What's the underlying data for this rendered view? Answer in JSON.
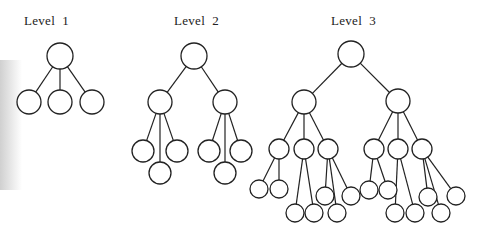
{
  "diagram": {
    "type": "tree-diagram",
    "trees": [
      {
        "label": "Level  1",
        "depth": 1,
        "root": {
          "children": [
            {},
            {},
            {}
          ]
        }
      },
      {
        "label": "Level  2",
        "depth": 2,
        "root": {
          "children": [
            {
              "children": [
                {},
                {},
                {}
              ]
            },
            {
              "children": [
                {},
                {},
                {}
              ]
            }
          ]
        }
      },
      {
        "label": "Level  3",
        "depth": 3,
        "root": {
          "children": [
            {
              "children": [
                {
                  "children": [
                    {},
                    {}
                  ]
                },
                {
                  "children": [
                    {},
                    {}
                  ]
                },
                {
                  "children": [
                    {},
                    {},
                    {}
                  ]
                }
              ]
            },
            {
              "children": [
                {
                  "children": [
                    {},
                    {}
                  ]
                },
                {
                  "children": [
                    {},
                    {}
                  ]
                },
                {
                  "children": [
                    {},
                    {},
                    {}
                  ]
                }
              ]
            }
          ]
        }
      }
    ]
  }
}
